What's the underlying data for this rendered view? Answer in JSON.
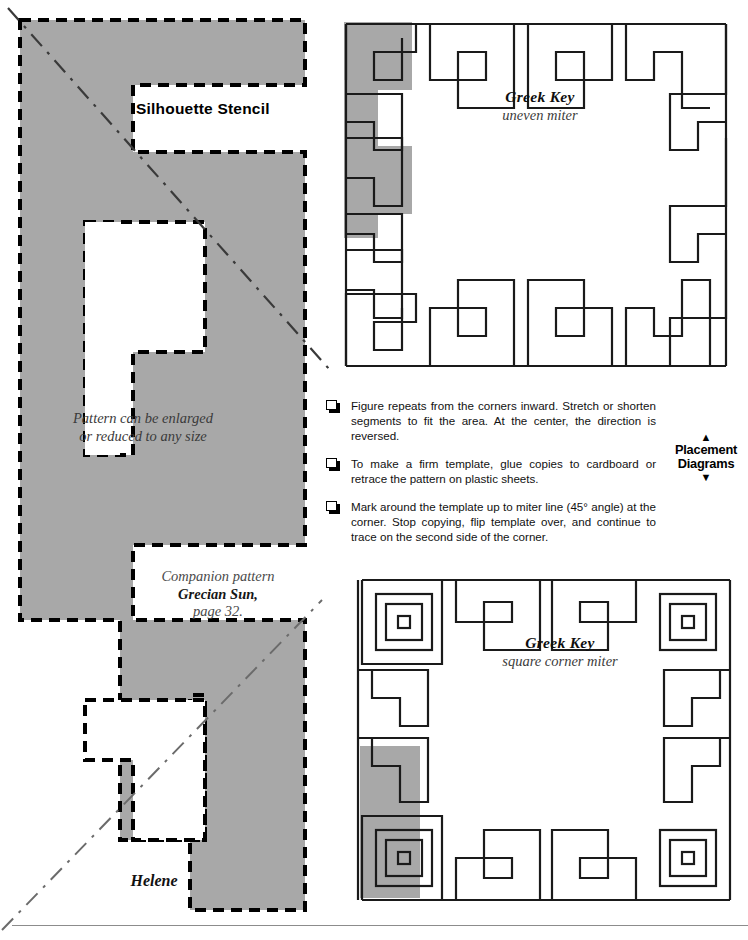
{
  "stencil": {
    "heading": "Silhouette Stencil",
    "note_enlarge": "Pattern can be enlarged\nor reduced to any size",
    "companion_label": "Companion pattern",
    "companion_name": "Grecian Sun,",
    "companion_page": "page 32.",
    "pattern_name": "Helene",
    "fill_color": "#a8a8a8",
    "outline_color": "#000000"
  },
  "diagrams": [
    {
      "id": "uneven-miter",
      "title": "Greek Key",
      "subtitle": "uneven miter",
      "shade_color": "#a8a8a8",
      "line_color": "#1a1a1a"
    },
    {
      "id": "square-corner-miter",
      "title": "Greek Key",
      "subtitle": "square corner miter",
      "shade_color": "#a8a8a8",
      "line_color": "#1a1a1a"
    }
  ],
  "instructions": [
    "Figure repeats from the corners inward. Stretch or shorten segments to fit the area. At the center, the direction is reversed.",
    "To make a firm template, glue copies to cardboard or retrace the pattern on plastic sheets.",
    "Mark around the template up to miter line (45° angle) at the corner. Stop copying, flip template over, and continue to trace on the second side of the corner."
  ],
  "placement": {
    "arrow_up": "▲",
    "line1": "Placement",
    "line2": "Diagrams",
    "arrow_down": "▼"
  }
}
